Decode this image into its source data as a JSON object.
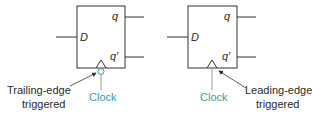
{
  "diagrams": [
    {
      "name": "trailing-edge-flipflop",
      "input_label": "D",
      "output_q": "q",
      "output_qbar": "q′",
      "clock_label": "Clock",
      "annotation_line1": "Trailing-edge",
      "annotation_line2": "triggered",
      "has_bubble": true
    },
    {
      "name": "leading-edge-flipflop",
      "input_label": "D",
      "output_q": "q",
      "output_qbar": "q′",
      "clock_label": "Clock",
      "annotation_line1": "Leading-edge",
      "annotation_line2": "triggered",
      "has_bubble": false
    }
  ],
  "colors": {
    "line": "#333333",
    "clock_text": "#3f97a6",
    "clock_line": "#9a9a9a"
  }
}
